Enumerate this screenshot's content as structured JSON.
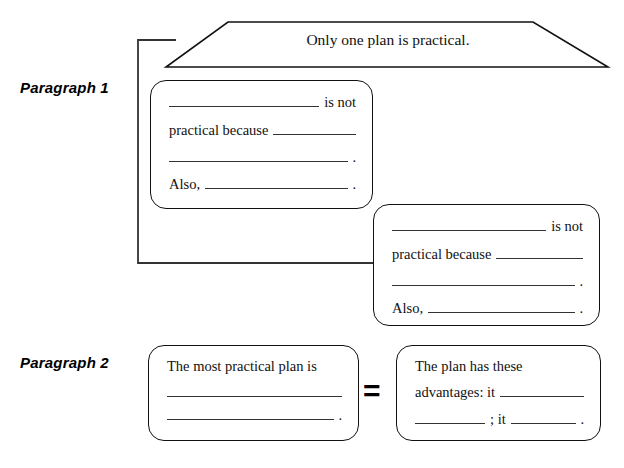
{
  "labels": {
    "paragraph1": "Paragraph 1",
    "paragraph2": "Paragraph 2"
  },
  "banner": {
    "text": "Only one plan is practical."
  },
  "boxes": {
    "p1_first": {
      "name": "paragraph-1-first-reason-box",
      "line1_suffix": "is not",
      "line2_prefix": "practical because",
      "line3_period": ".",
      "line4_prefix": "Also,",
      "line4_period": "."
    },
    "p1_second": {
      "name": "paragraph-1-second-reason-box",
      "line1_suffix": "is not",
      "line2_prefix": "practical because",
      "line3_period": ".",
      "line4_prefix": "Also,",
      "line4_period": "."
    },
    "p2_first": {
      "name": "paragraph-2-plan-box",
      "line1": "The most practical plan is",
      "line3_period": "."
    },
    "p2_second": {
      "name": "paragraph-2-advantages-box",
      "line1": "The plan has these",
      "line2_prefix": "advantages: it",
      "line3_mid": "; it",
      "line3_period": "."
    }
  },
  "operators": {
    "equals": "="
  },
  "colors": {
    "ink": "#111111",
    "rule": "#333333",
    "background": "#ffffff"
  }
}
